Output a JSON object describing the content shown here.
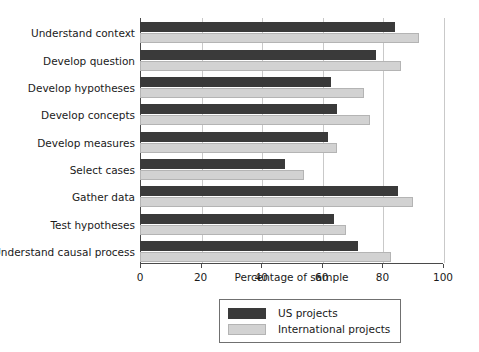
{
  "chart_data": {
    "type": "bar",
    "orientation": "horizontal",
    "title": "",
    "xlabel": "Percentage of sample",
    "ylabel": "",
    "xlim": [
      0,
      100
    ],
    "xticks": [
      0,
      20,
      40,
      60,
      80,
      100
    ],
    "grid": true,
    "legend_position": "bottom-center",
    "categories": [
      "Understand context",
      "Develop question",
      "Develop hypotheses",
      "Develop concepts",
      "Develop measures",
      "Select cases",
      "Gather data",
      "Test hypotheses",
      "Understand causal process"
    ],
    "series": [
      {
        "name": "US projects",
        "color": "#3a3a3a",
        "values": [
          84,
          78,
          63,
          65,
          62,
          48,
          85,
          64,
          72
        ]
      },
      {
        "name": "International projects",
        "color": "#d2d2d2",
        "values": [
          92,
          86,
          74,
          76,
          65,
          54,
          90,
          68,
          83
        ]
      }
    ]
  },
  "legend": {
    "items": [
      {
        "label": "US projects",
        "swatch": "us"
      },
      {
        "label": "International projects",
        "swatch": "intl"
      }
    ]
  },
  "axis": {
    "x_label": "Percentage of sample",
    "tick_labels": [
      "0",
      "20",
      "40",
      "60",
      "80",
      "100"
    ]
  }
}
